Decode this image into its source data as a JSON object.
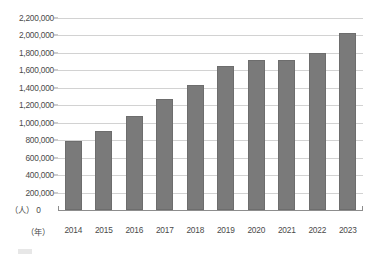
{
  "chart_data": {
    "type": "bar",
    "title": "",
    "xlabel": "(年)",
    "ylabel": "(人)",
    "categories": [
      "2014",
      "2015",
      "2016",
      "2017",
      "2018",
      "2019",
      "2020",
      "2021",
      "2022",
      "2023"
    ],
    "values": [
      790000,
      900000,
      1075000,
      1270000,
      1430000,
      1650000,
      1720000,
      1715000,
      1800000,
      2030000
    ],
    "series": [
      {
        "name": "",
        "values": [
          790000,
          900000,
          1075000,
          1270000,
          1430000,
          1650000,
          1720000,
          1715000,
          1800000,
          2030000
        ]
      }
    ],
    "ylim": [
      0,
      2200000
    ],
    "ytick_step": 200000,
    "ytick_labels": [
      "2,200,000",
      "2,000,000",
      "1,800,000",
      "1,600,000",
      "1,400,000",
      "1,200,000",
      "1,000,000",
      "800,000",
      "600,000",
      "400,000",
      "200,000",
      "0"
    ],
    "ytick_values": [
      2200000,
      2000000,
      1800000,
      1600000,
      1400000,
      1200000,
      1000000,
      800000,
      600000,
      400000,
      200000,
      0
    ],
    "grid": true,
    "legend_position": "bottom",
    "bar_color": "#7a7a7a",
    "grid_color": "#d2d2d2",
    "axis_color": "#8d8d8d"
  },
  "axis": {
    "unit_person": "（人）",
    "unit_person_zero": "0",
    "unit_year": "（年）"
  },
  "legend": {
    "label": ""
  }
}
